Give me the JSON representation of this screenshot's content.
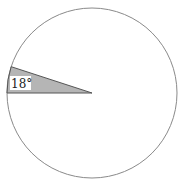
{
  "diagram": {
    "type": "pie",
    "shape": "circle",
    "sector": {
      "label": "18°",
      "angle_degrees": 18,
      "fill": "#b5b5b5"
    },
    "colors": {
      "background": "#ffffff",
      "circle_stroke": "#8a8a8a",
      "sector_fill": "#b5b5b5",
      "sector_stroke": "#555555",
      "label_bg": "#ffffff"
    }
  }
}
